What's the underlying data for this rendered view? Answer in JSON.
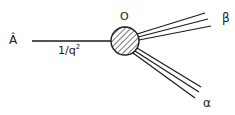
{
  "diagram": {
    "type": "feynman-like vertex diagram",
    "labels": {
      "incoming": "Â",
      "propagator": "1/q",
      "propagator_exp": "2",
      "vertex": "O",
      "upper_outgoing": "β",
      "lower_outgoing": "α"
    },
    "colors": {
      "ink": "#1a1a1a",
      "background": "#ffffff"
    }
  }
}
